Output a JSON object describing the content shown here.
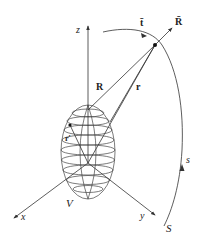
{
  "diagram": {
    "type": "vector-geometry",
    "labels": {
      "z_axis": "z",
      "x_axis": "x",
      "y_axis": "y",
      "R_vec": "R",
      "r_vec": "r",
      "r_prime": "r′",
      "t_bar": "t̄",
      "R_bar": "R̄",
      "volume": "V",
      "curve": "S",
      "arc_param": "s"
    },
    "colors": {
      "line": "#333333",
      "text": "#222222",
      "background": "#ffffff"
    }
  }
}
